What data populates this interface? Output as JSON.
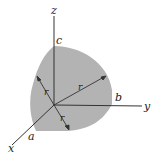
{
  "figure": {
    "colors": {
      "surface": "#b3b3b3",
      "axis": "#333333",
      "background": "#ffffff"
    },
    "axes": {
      "x": "x",
      "y": "y",
      "z": "z"
    },
    "intercepts": {
      "a": "a",
      "b": "b",
      "c": "c"
    },
    "radius_labels": [
      "r",
      "r",
      "r"
    ]
  }
}
